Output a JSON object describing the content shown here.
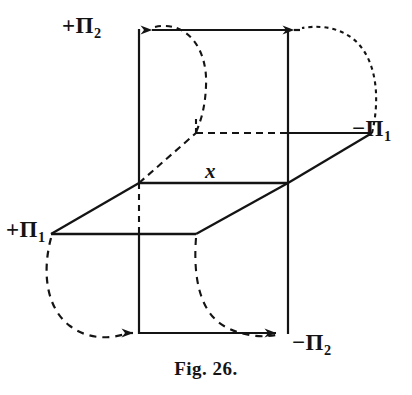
{
  "figure": {
    "caption": "Fig. 26.",
    "ground_line_label": "x",
    "stroke_color": "#141414",
    "background_color": "#ffffff",
    "labels": [
      {
        "id": "plus-pi2",
        "sign": "+",
        "symbol": "Π",
        "subscript": "2",
        "position": "top-left"
      },
      {
        "id": "minus-pi1",
        "sign": "−",
        "symbol": "Π",
        "subscript": "1",
        "position": "right"
      },
      {
        "id": "plus-pi1",
        "sign": "+",
        "symbol": "Π",
        "subscript": "1",
        "position": "bottom-left"
      },
      {
        "id": "minus-pi2",
        "sign": "−",
        "symbol": "Π",
        "subscript": "2",
        "position": "bottom-right"
      }
    ]
  }
}
